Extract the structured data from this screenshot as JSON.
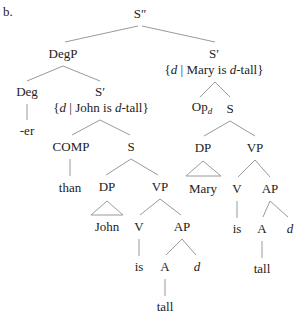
{
  "example_label": "b.",
  "tree": {
    "root": "S″",
    "degp": "DegP",
    "deg": "Deg",
    "er": "-er",
    "s_prime_left": "S′",
    "set_left": {
      "pre": "{",
      "var": "d",
      "mid": " | John is ",
      "var2": "d",
      "post": "-tall}"
    },
    "comp": "COMP",
    "than": "than",
    "s_left": "S",
    "dp_left": "DP",
    "john": "John",
    "vp_left": "VP",
    "v_left": "V",
    "is_left": "is",
    "ap_left": "AP",
    "a_left": "A",
    "tall_left": "tall",
    "d_left": "d",
    "s_prime_right": "S′",
    "set_right": {
      "pre": "{",
      "var": "d",
      "mid": " | Mary is ",
      "var2": "d",
      "post": "-tall}"
    },
    "op": "Op",
    "op_sub": "d",
    "s_right": "S",
    "dp_right": "DP",
    "mary": "Mary",
    "vp_right": "VP",
    "v_right": "V",
    "is_right": "is",
    "ap_right": "AP",
    "a_right": "A",
    "tall_right": "tall",
    "d_right": "d"
  },
  "colors": {
    "edge": "#9a9a9a",
    "text": "#222222"
  }
}
